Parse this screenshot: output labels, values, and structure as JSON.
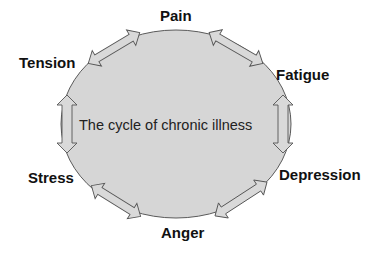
{
  "diagram": {
    "title": "The cycle of chronic illness",
    "center_label": "The cycle of chronic illness",
    "nodes": [
      {
        "id": "pain",
        "label": "Pain"
      },
      {
        "id": "fatigue",
        "label": "Fatigue"
      },
      {
        "id": "depression",
        "label": "Depression"
      },
      {
        "id": "anger",
        "label": "Anger"
      },
      {
        "id": "stress",
        "label": "Stress"
      },
      {
        "id": "tension",
        "label": "Tension"
      }
    ],
    "edges": [
      {
        "from": "tension",
        "to": "pain",
        "type": "bidirectional"
      },
      {
        "from": "pain",
        "to": "fatigue",
        "type": "bidirectional"
      },
      {
        "from": "fatigue",
        "to": "depression",
        "type": "bidirectional"
      },
      {
        "from": "depression",
        "to": "anger",
        "type": "bidirectional"
      },
      {
        "from": "anger",
        "to": "stress",
        "type": "bidirectional"
      },
      {
        "from": "stress",
        "to": "tension",
        "type": "bidirectional"
      }
    ],
    "colors": {
      "ellipse_fill": "#d6d6d6",
      "ellipse_stroke": "#5a5a5a",
      "arrow_fill": "#d9d9d9",
      "arrow_stroke": "#555555",
      "label_text": "#111111",
      "background": "#ffffff"
    }
  }
}
